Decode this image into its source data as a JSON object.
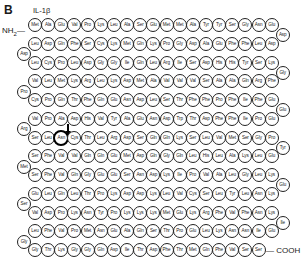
{
  "figure": {
    "panel_label": "B",
    "protein_name": "IL-1β",
    "n_terminus": "NH",
    "n_terminus_sub": "2",
    "c_terminus": "— COOH",
    "highlighted_residue": {
      "row": 6,
      "index": 2,
      "label": "Asn"
    },
    "cleavage_arrow": {
      "row": 5,
      "between_index": [
        2,
        3
      ],
      "label": ""
    }
  },
  "sequence_rows": [
    {
      "dir": "ltr",
      "residues": [
        "Met",
        "Ala",
        "Glu",
        "Val",
        "Pro",
        "Lys",
        "Leu",
        "Ala",
        "Ser",
        "Glu",
        "Met",
        "Met",
        "Ala",
        "Tyr",
        "Tyr",
        "Ser",
        "Gly",
        "Asn",
        "Glu"
      ]
    },
    {
      "dir": "ltr",
      "residues": [
        "Leu",
        "Asp",
        "Gln",
        "Phe",
        "Ser",
        "Cys",
        "Lys",
        "Met",
        "Gln",
        "Lys",
        "Pro",
        "Gly",
        "Asp",
        "Ala",
        "Glu",
        "Phe",
        "Phe",
        "Leu",
        "Asp"
      ]
    },
    {
      "dir": "ltr",
      "residues": [
        "Leu",
        "Cys",
        "Pro",
        "Leu",
        "Asp",
        "Gly",
        "Gly",
        "Ile",
        "Gln",
        "Leu",
        "Arg",
        "Ile",
        "Ser",
        "Asp",
        "His",
        "His",
        "Tyr",
        "Ser",
        "Lys"
      ]
    },
    {
      "dir": "ltr",
      "residues": [
        "Val",
        "Leu",
        "Met",
        "Lys",
        "Arg",
        "Leu",
        "Lys",
        "Asp",
        "Met",
        "Ala",
        "Val",
        "Val",
        "Val",
        "Ser",
        "Ala",
        "Ala",
        "Gln",
        "Arg",
        "Phe"
      ]
    },
    {
      "dir": "ltr",
      "residues": [
        "Cys",
        "Pro",
        "Gln",
        "Thr",
        "Phe",
        "Gln",
        "Glu",
        "Asn",
        "Asp",
        "Leu",
        "Ser",
        "Thr",
        "Phe",
        "Phe",
        "Pro",
        "Phe",
        "Ile",
        "Phe",
        "Glu"
      ]
    },
    {
      "dir": "ltr",
      "residues": [
        "Val",
        "Pro",
        "Ala",
        "Asp",
        "His",
        "Val",
        "Tyr",
        "Ala",
        "Glu",
        "Asn",
        "Asp",
        "Trp",
        "Thr",
        "Asp",
        "Phe",
        "Phe",
        "Ile",
        "Pro",
        "Glu"
      ]
    },
    {
      "dir": "ltr",
      "residues": [
        "Ser",
        "Leu",
        "Asn",
        "Cys",
        "Thr",
        "Leu",
        "Arg",
        "Asp",
        "Ser",
        "Gln",
        "Gln",
        "Lys",
        "Ser",
        "Leu",
        "Val",
        "Met",
        "Ser",
        "Gly",
        "Pro"
      ]
    },
    {
      "dir": "ltr",
      "residues": [
        "Ser",
        "Phe",
        "Val",
        "Val",
        "Gln",
        "Gln",
        "Glu",
        "Met",
        "Asp",
        "Gln",
        "Gly",
        "Gln",
        "Leu",
        "His",
        "Leu",
        "Ala",
        "Lys",
        "Leu",
        "Glu"
      ]
    },
    {
      "dir": "ltr",
      "residues": [
        "Ser",
        "Phe",
        "Val",
        "Gln",
        "Gly",
        "Glu",
        "Glu",
        "Ser",
        "Asn",
        "Asp",
        "Lys",
        "Ile",
        "Pro",
        "Val",
        "Ala",
        "Leu",
        "Gly",
        "Leu",
        "Lys"
      ]
    },
    {
      "dir": "ltr",
      "residues": [
        "Glu",
        "Leu",
        "Gln",
        "Leu",
        "Thr",
        "Pro",
        "Lys",
        "Asp",
        "Asp",
        "Lys",
        "Leu",
        "Val",
        "Cys",
        "Ser",
        "Leu",
        "Tyr",
        "Leu",
        "Asn",
        "Lys"
      ]
    },
    {
      "dir": "ltr",
      "residues": [
        "Val",
        "Asp",
        "Pro",
        "Lys",
        "Asn",
        "Tyr",
        "Pro",
        "Lys",
        "Lys",
        "Lys",
        "Met",
        "Glu",
        "Lys",
        "Arg",
        "Phe",
        "Val",
        "Phe",
        "Asn",
        "Lys"
      ]
    },
    {
      "dir": "ltr",
      "residues": [
        "Leu",
        "Phe",
        "Val",
        "Pro",
        "Met",
        "Asn",
        "Glu",
        "Ala",
        "Gln",
        "Ser",
        "Thr",
        "Pro",
        "Glu",
        "Leu",
        "Lys",
        "Asn",
        "Asn",
        "Ile",
        "Glu"
      ]
    },
    {
      "dir": "ltr",
      "residues": [
        "Gly",
        "Thr",
        "Lys",
        "Gly",
        "Gly",
        "Gln",
        "Asp",
        "Ile",
        "Thr",
        "Asp",
        "Phe",
        "Thr",
        "Met",
        "Gln",
        "Phe",
        "Val",
        "Ser",
        "Ser"
      ]
    }
  ],
  "turns": [
    {
      "side": "right",
      "after_row": 0,
      "residue": "Asp"
    },
    {
      "side": "left",
      "after_row": 1,
      "residue": "Asp"
    },
    {
      "side": "right",
      "after_row": 2,
      "residue": "Gly"
    },
    {
      "side": "left",
      "after_row": 3,
      "residue": "Pro"
    },
    {
      "side": "right",
      "after_row": 4,
      "residue": "Glu"
    },
    {
      "side": "left",
      "after_row": 5,
      "residue": "Arg"
    },
    {
      "side": "right",
      "after_row": 6,
      "residue": "Tyr"
    },
    {
      "side": "left",
      "after_row": 7,
      "residue": "Met"
    },
    {
      "side": "right",
      "after_row": 8,
      "residue": "Glu"
    },
    {
      "side": "left",
      "after_row": 9,
      "residue": "Ser"
    },
    {
      "side": "right",
      "after_row": 10,
      "residue": "Ile"
    },
    {
      "side": "left",
      "after_row": 11,
      "residue": "Gly"
    }
  ]
}
